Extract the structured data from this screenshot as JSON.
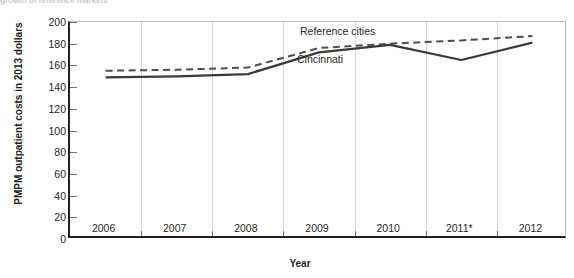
{
  "figure": {
    "cropped_title": "growth of reference markets",
    "ylabel": "PMPM outpatient costs in 2013 dollars",
    "xlabel": "Year"
  },
  "chart_data": {
    "type": "line",
    "title": "",
    "xlabel": "Year",
    "ylabel": "PMPM outpatient costs in 2013 dollars",
    "categories": [
      "2006",
      "2007",
      "2008",
      "2009",
      "2010",
      "2011*",
      "2012"
    ],
    "ylim": [
      0,
      200
    ],
    "yticks": [
      0,
      20,
      40,
      60,
      80,
      100,
      120,
      140,
      160,
      180,
      200
    ],
    "grid": false,
    "legend_position": "inline-annotation",
    "series": [
      {
        "name": "Reference cities",
        "style": "dashed",
        "color": "#4d4d4d",
        "values": [
          155,
          156,
          158,
          176,
          180,
          183,
          187
        ]
      },
      {
        "name": "Cincinnati",
        "style": "solid",
        "color": "#3a3a3a",
        "values": [
          149,
          150,
          152,
          172,
          179,
          165,
          181
        ]
      }
    ],
    "annotations": [
      {
        "text": "Reference cities",
        "series": "Reference cities"
      },
      {
        "text": "Cincinnati",
        "series": "Cincinnati"
      }
    ]
  }
}
